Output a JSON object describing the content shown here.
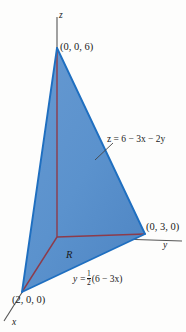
{
  "figure": {
    "axes": {
      "x_label": "x",
      "y_label": "y",
      "z_label": "z"
    },
    "labels": {
      "vertex_z": "(0, 0, 6)",
      "vertex_y": "(0, 3, 0)",
      "vertex_x": "(2, 0, 0)",
      "region": "R",
      "plane_equation": "z = 6 − 3x − 2y",
      "base_line_lhs": "y =",
      "base_line_num": "1",
      "base_line_den": "2",
      "base_line_rhs": "(6 − 3x)"
    },
    "colors": {
      "front_face": "#5b92cd",
      "front_face_dark": "#4a81bd",
      "left_face": "#cfe2f3",
      "base_face": "#e4f0fa",
      "edge_blue": "#1f6fc0",
      "edge_maroon": "#8d3b4a",
      "axis_gray": "#555555",
      "text": "#1a1a1a"
    },
    "geometry": {
      "apex_z": [
        57,
        48
      ],
      "origin": [
        57,
        237
      ],
      "vertex_y_point": [
        145,
        234
      ],
      "vertex_x_point": [
        22,
        292
      ],
      "y_axis_end": [
        182,
        241
      ],
      "x_axis_end": [
        4,
        320
      ],
      "z_axis_top": [
        57,
        17
      ]
    }
  }
}
